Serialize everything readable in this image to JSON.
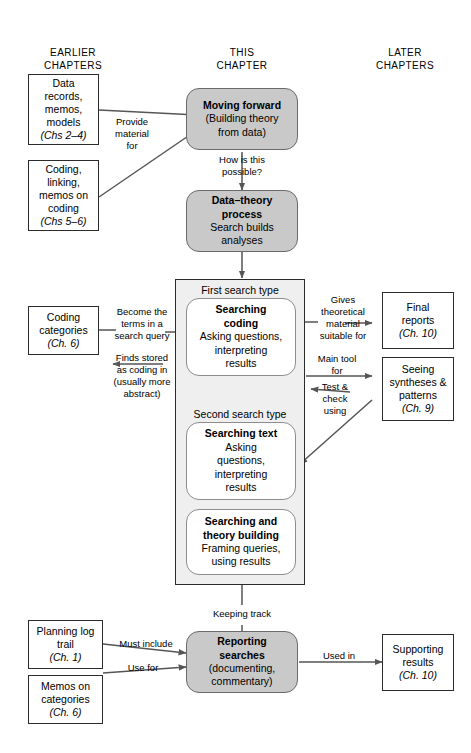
{
  "figure": {
    "colors": {
      "box_fill": "#ffffff",
      "box_border": "#2b2b2b",
      "grey_node_fill": "#c9c9c9",
      "grey_node_border": "#6a6a6a",
      "panel_fill": "#efefef",
      "panel_border": "#2b2b2b",
      "arrow": "#555555",
      "text": "#000000"
    }
  },
  "columns": [
    {
      "id": "earlier",
      "label": "EARLIER\nCHAPTERS"
    },
    {
      "id": "this",
      "label": "THIS\nCHAPTER"
    },
    {
      "id": "later",
      "label": "LATER\nCHAPTERS"
    }
  ],
  "nodes": {
    "data_records": {
      "lines": [
        "Data",
        "records,",
        "memos,",
        "models"
      ],
      "chapter": "(Chs 2–4)"
    },
    "coding_linking": {
      "lines": [
        "Coding,",
        "linking,",
        "memos on",
        "coding"
      ],
      "chapter": "(Chs 5–6)"
    },
    "coding_categories": {
      "lines": [
        "Coding",
        "categories"
      ],
      "chapter": "(Ch. 6)"
    },
    "planning_log": {
      "lines": [
        "Planning log",
        "trail"
      ],
      "chapter": "(Ch. 1)"
    },
    "memos_categories": {
      "lines": [
        "Memos on",
        "categories"
      ],
      "chapter": "(Ch. 6)"
    },
    "final_reports": {
      "lines": [
        "Final",
        "reports"
      ],
      "chapter": "(Ch. 10)"
    },
    "seeing_syntheses": {
      "lines": [
        "Seeing",
        "syntheses &",
        "patterns"
      ],
      "chapter": "(Ch. 9)"
    },
    "supporting_results": {
      "lines": [
        "Supporting",
        "results"
      ],
      "chapter": "(Ch. 10)"
    },
    "moving_forward": {
      "title": "Moving forward",
      "body": "(Building theory\nfrom data)"
    },
    "data_theory": {
      "title": "Data–theory\nprocess",
      "body": "Search builds\nanalyses"
    },
    "searching_coding": {
      "title": "Searching\ncoding",
      "body": "Asking questions,\ninterpreting\nresults"
    },
    "searching_text": {
      "title": "Searching text",
      "body": "Asking\nquestions,\ninterpreting\nresults"
    },
    "searching_theory": {
      "title": "Searching and\ntheory building",
      "body": "Framing queries,\nusing results"
    },
    "reporting_searches": {
      "title": "Reporting\nsearches",
      "body": "(documenting,\ncommentary)"
    }
  },
  "panel": {
    "first_search_type": "First search type",
    "second_search_type": "Second search type"
  },
  "edges": [
    {
      "id": "provide-material",
      "label": "Provide\nmaterial\nfor"
    },
    {
      "id": "how-possible",
      "label": "How is this\npossible?"
    },
    {
      "id": "become-terms",
      "label": "Become the\nterms in a\nsearch query"
    },
    {
      "id": "finds-stored",
      "label": "Finds stored\nas coding in\n(usually more\nabstract)"
    },
    {
      "id": "gives-theoretical",
      "label": "Gives\ntheoretical\nmaterial\nsuitable for"
    },
    {
      "id": "main-tool",
      "label": "Main tool\nfor"
    },
    {
      "id": "test-check",
      "label": "Test &\ncheck\nusing"
    },
    {
      "id": "keeping-track",
      "label": "Keeping track"
    },
    {
      "id": "must-include",
      "label": "Must include"
    },
    {
      "id": "use-for",
      "label": "Use for"
    },
    {
      "id": "used-in",
      "label": "Used in"
    }
  ]
}
